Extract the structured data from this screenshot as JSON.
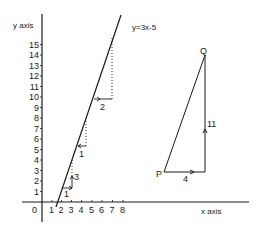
{
  "diagram": {
    "title": "",
    "y_axis_label": "y axis",
    "x_axis_label": "x axis",
    "origin_label": "0",
    "x_ticks": [
      "1",
      "2",
      "3",
      "4",
      "5",
      "6",
      "7",
      "8"
    ],
    "y_ticks": [
      "1",
      "2",
      "3",
      "4",
      "5",
      "6",
      "7",
      "8",
      "9",
      "10",
      "11",
      "12",
      "13",
      "14",
      "15"
    ],
    "line_equation": "y=3x-5",
    "step_triangles": [
      {
        "run": "1",
        "rise": "3"
      },
      {
        "run": "1",
        "rise": ""
      },
      {
        "run": "2",
        "rise": ""
      }
    ],
    "right_triangle": {
      "point_p": "P",
      "point_q": "Q",
      "run_label": "4",
      "rise_label": "11"
    },
    "colors": {
      "ink": "#1a1a1a",
      "background": "#ffffff"
    }
  }
}
